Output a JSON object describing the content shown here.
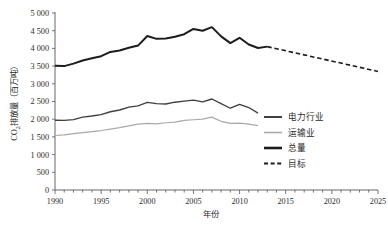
{
  "chart_data": {
    "type": "line",
    "title": "",
    "xlabel": "年份",
    "ylabel": "CO2排放量（百万吨）",
    "ylabel_parts": {
      "prefix": "CO",
      "sub": "2",
      "suffix": "排放量（百万吨）"
    },
    "xlim": [
      1990,
      2025
    ],
    "ylim": [
      0,
      5000
    ],
    "grid": false,
    "legend_position": "right-middle",
    "x_tick_labels": [
      "1990",
      "1995",
      "2000",
      "2005",
      "2010",
      "2015",
      "2020",
      "2025"
    ],
    "x_tick_values": [
      1990,
      1995,
      2000,
      2005,
      2010,
      2015,
      2020,
      2025
    ],
    "x_minor_tick_step": 1,
    "y_tick_labels": [
      "0",
      "500",
      "1 000",
      "1 500",
      "2 000",
      "2 500",
      "3 000",
      "3 500",
      "4 000",
      "4 500",
      "5 000"
    ],
    "y_tick_values": [
      0,
      500,
      1000,
      1500,
      2000,
      2500,
      3000,
      3500,
      4000,
      4500,
      5000
    ],
    "x": [
      1990,
      1991,
      1992,
      1993,
      1994,
      1995,
      1996,
      1997,
      1998,
      1999,
      2000,
      2001,
      2002,
      2003,
      2004,
      2005,
      2006,
      2007,
      2008,
      2009,
      2010,
      2011,
      2012
    ],
    "series": [
      {
        "name": "电力行业",
        "color": "#404040",
        "width": 1.35,
        "style": "solid",
        "x": [
          1990,
          1991,
          1992,
          1993,
          1994,
          1995,
          1996,
          1997,
          1998,
          1999,
          2000,
          2001,
          2002,
          2003,
          2004,
          2005,
          2006,
          2007,
          2008,
          2009,
          2010,
          2011,
          2012
        ],
        "values": [
          1970,
          1965,
          1990,
          2060,
          2090,
          2130,
          2210,
          2260,
          2340,
          2375,
          2475,
          2440,
          2430,
          2480,
          2510,
          2540,
          2490,
          2570,
          2440,
          2310,
          2420,
          2330,
          2170
        ]
      },
      {
        "name": "运输业",
        "color": "#aaaaaa",
        "width": 1.2,
        "style": "solid",
        "x": [
          1990,
          1991,
          1992,
          1993,
          1994,
          1995,
          1996,
          1997,
          1998,
          1999,
          2000,
          2001,
          2002,
          2003,
          2004,
          2005,
          2006,
          2007,
          2008,
          2009,
          2010,
          2011,
          2012
        ],
        "values": [
          1540,
          1555,
          1590,
          1620,
          1650,
          1680,
          1720,
          1760,
          1810,
          1860,
          1880,
          1870,
          1900,
          1915,
          1965,
          1985,
          2000,
          2060,
          1940,
          1880,
          1890,
          1860,
          1820
        ]
      },
      {
        "name": "总量",
        "color": "#1c1c1c",
        "width": 2.0,
        "style": "solid",
        "x": [
          1990,
          1991,
          1992,
          1993,
          1994,
          1995,
          1996,
          1997,
          1998,
          1999,
          2000,
          2001,
          2002,
          2003,
          2004,
          2005,
          2006,
          2007,
          2008,
          2009,
          2010,
          2011,
          2012,
          2013
        ],
        "values": [
          3510,
          3500,
          3570,
          3660,
          3720,
          3780,
          3900,
          3940,
          4020,
          4080,
          4350,
          4270,
          4280,
          4330,
          4400,
          4550,
          4500,
          4600,
          4340,
          4150,
          4300,
          4110,
          4010,
          4050
        ]
      },
      {
        "name": "目标",
        "color": "#1c1c1c",
        "width": 1.6,
        "style": "dashed",
        "x": [
          2013,
          2025
        ],
        "values": [
          4050,
          3350
        ]
      }
    ],
    "legend": [
      {
        "label": "电力行业",
        "color": "#404040",
        "style": "solid",
        "width": 2.0
      },
      {
        "label": "运输业",
        "color": "#aaaaaa",
        "style": "solid",
        "width": 1.6
      },
      {
        "label": "总量",
        "color": "#1c1c1c",
        "style": "solid",
        "width": 2.6
      },
      {
        "label": "目标",
        "color": "#1c1c1c",
        "style": "dashed",
        "width": 2.2
      }
    ]
  }
}
